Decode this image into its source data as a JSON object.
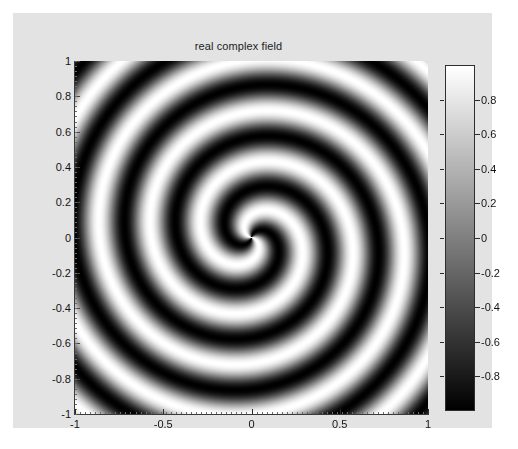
{
  "figure": {
    "background_color": "#e3e3e3",
    "page_color": "#ffffff"
  },
  "title": "real complex field",
  "axes": {
    "xlabel": "",
    "ylabel": "",
    "xticks": [
      "-1",
      "-0.5",
      "0",
      "0.5",
      "1"
    ],
    "xtick_values": [
      -1,
      -0.5,
      0,
      0.5,
      1
    ],
    "yticks": [
      "1",
      "0.8",
      "0.6",
      "0.4",
      "0.2",
      "0",
      "-0.2",
      "-0.4",
      "-0.6",
      "-0.8",
      "-1"
    ],
    "ytick_values": [
      1,
      0.8,
      0.6,
      0.4,
      0.2,
      0,
      -0.2,
      -0.4,
      -0.6,
      -0.8,
      -1
    ],
    "xlim": [
      -1,
      1
    ],
    "ylim": [
      -1,
      1
    ]
  },
  "colorbar": {
    "orientation": "vertical",
    "colormap": "gray",
    "top_color": "#ffffff",
    "bottom_color": "#000000",
    "ticks": [
      "0.8",
      "0.6",
      "0.4",
      "0.2",
      "0",
      "-0.2",
      "-0.4",
      "-0.6",
      "-0.8"
    ],
    "tick_values": [
      0.8,
      0.6,
      0.4,
      0.2,
      0,
      -0.2,
      -0.4,
      -0.6,
      -0.8
    ],
    "clim": [
      -1,
      1
    ]
  },
  "chart_data": {
    "type": "heatmap",
    "title": "real complex field",
    "xlabel": "",
    "ylabel": "",
    "xlim": [
      -1,
      1
    ],
    "ylim": [
      -1,
      1
    ],
    "zlim": [
      -1,
      1
    ],
    "colormap": "gray",
    "grid": false,
    "legend": "none",
    "formula": "z = cos(2*theta + k*r), theta = atan2(y,x), r = sqrt(x^2+y^2), k = 21.5",
    "azimuthal_charge": 2,
    "radial_wavenumber": 21.5,
    "phase_offset_rad": 0.35,
    "grid_size": [
      201,
      201
    ],
    "x_range": [
      -1,
      1
    ],
    "y_range": [
      -1,
      1
    ],
    "value_range": [
      -1,
      1
    ],
    "colorbar_ticks": [
      0.8,
      0.6,
      0.4,
      0.2,
      0,
      -0.2,
      -0.4,
      -0.6,
      -0.8
    ],
    "sample_profile_along_positive_x": {
      "r": [
        0.0,
        0.1,
        0.2,
        0.3,
        0.4,
        0.5,
        0.6,
        0.7,
        0.8,
        0.9,
        1.0
      ],
      "value": [
        1.0,
        -0.63,
        -0.25,
        0.92,
        -0.42,
        -0.52,
        0.95,
        -0.12,
        -0.8,
        0.76,
        0.25
      ]
    }
  }
}
